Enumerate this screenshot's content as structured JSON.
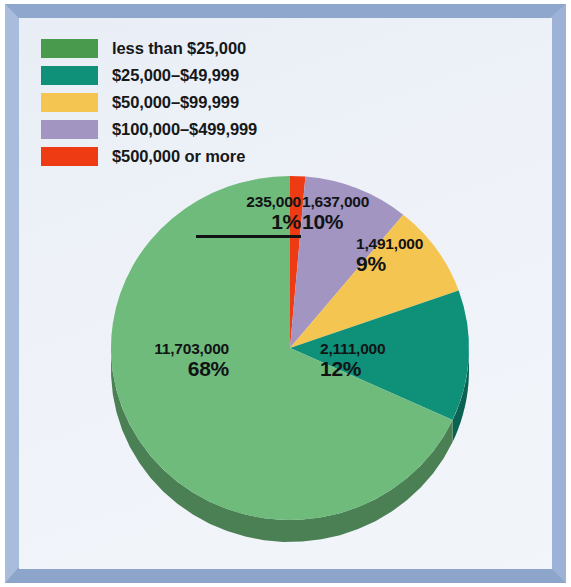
{
  "legend": {
    "items": [
      {
        "label": "less than $25,000",
        "color": "#4a9a4e"
      },
      {
        "label": "$25,000–$49,999",
        "color": "#0f9079"
      },
      {
        "label": "$50,000–$99,999",
        "color": "#f5c551"
      },
      {
        "label": "$100,000–$499,999",
        "color": "#a295c2"
      },
      {
        "label": "$500,000 or more",
        "color": "#ef3b14"
      }
    ]
  },
  "labels": {
    "red": {
      "value": "235,000",
      "pct": "1%"
    },
    "purple": {
      "value": "1,637,000",
      "pct": "10%"
    },
    "yellow": {
      "value": "1,491,000",
      "pct": "9%"
    },
    "teal": {
      "value": "2,111,000",
      "pct": "12%"
    },
    "green": {
      "value": "11,703,000",
      "pct": "68%"
    }
  },
  "chart_data": {
    "type": "pie",
    "title": "",
    "categories": [
      "$500,000 or more",
      "$100,000–$499,999",
      "$50,000–$99,999",
      "$25,000–$49,999",
      "less than $25,000"
    ],
    "values": [
      235000,
      1637000,
      1491000,
      2111000,
      11703000
    ],
    "percentages": [
      1,
      10,
      9,
      12,
      68
    ],
    "value_labels": [
      "235,000",
      "1,637,000",
      "1,491,000",
      "2,111,000",
      "11,703,000"
    ],
    "percent_labels": [
      "1%",
      "10%",
      "9%",
      "12%",
      "68%"
    ],
    "colors": [
      "#ef3b14",
      "#a295c2",
      "#f5c551",
      "#0f9079",
      "#6fbb7c"
    ],
    "legend_position": "top-left",
    "start_angle_deg": 0,
    "direction": "clockwise",
    "three_d": true,
    "grid": false
  },
  "geometry": {
    "center_x": 271,
    "center_y": 330,
    "radius_x": 179,
    "radius_y": 172,
    "depth": 22
  }
}
